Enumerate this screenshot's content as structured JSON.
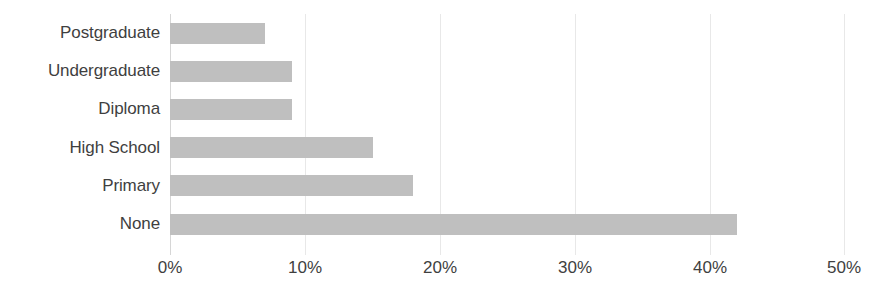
{
  "chart_data": {
    "type": "bar",
    "orientation": "horizontal",
    "title": "",
    "subtitle": "",
    "xlabel": "",
    "ylabel": "",
    "categories": [
      "None",
      "Primary",
      "High School",
      "Diploma",
      "Undergraduate",
      "Postgraduate"
    ],
    "values": [
      42,
      18,
      15,
      9,
      9,
      7
    ],
    "value_unit": "%",
    "xlim": [
      0,
      50
    ],
    "xticks": [
      0,
      10,
      20,
      30,
      40,
      50
    ],
    "xtick_labels": [
      "0%",
      "10%",
      "20%",
      "30%",
      "40%",
      "50%"
    ],
    "grid": "vertical",
    "legend": "none",
    "series": [
      {
        "name": "",
        "color": "#bfbfbf",
        "points": [
          {
            "category": "Postgraduate",
            "value": 7
          },
          {
            "category": "Undergraduate",
            "value": 9
          },
          {
            "category": "Diploma",
            "value": 9
          },
          {
            "category": "High School",
            "value": 15
          },
          {
            "category": "Primary",
            "value": 18
          },
          {
            "category": "None",
            "value": 42
          }
        ]
      }
    ],
    "colors": {
      "bar": "#bfbfbf",
      "gridline": "#e8e8e8",
      "axis": "#d6d6d6",
      "text": "#3f3f3f",
      "background": "#ffffff"
    }
  }
}
